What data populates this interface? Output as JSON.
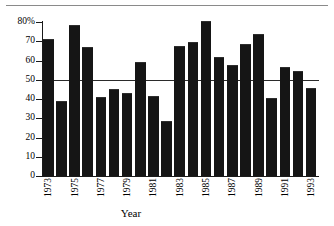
{
  "chart_data": {
    "type": "bar",
    "title": "",
    "subtitle": "",
    "xlabel": "Year",
    "ylabel": "",
    "categories": [
      "1973",
      "1974",
      "1975",
      "1976",
      "1977",
      "1978",
      "1979",
      "1980",
      "1981",
      "1982",
      "1983",
      "1984",
      "1985",
      "1986",
      "1987",
      "1988",
      "1989",
      "1990",
      "1991",
      "1992",
      "1993"
    ],
    "values": [
      71,
      39,
      78.5,
      67,
      41,
      45,
      43,
      59,
      41.5,
      28.5,
      67.5,
      69.5,
      80.5,
      62,
      57.5,
      68.5,
      74,
      40.5,
      56.5,
      54.5,
      45.5
    ],
    "ylim": [
      0,
      80
    ],
    "yticks": [
      0,
      10,
      20,
      30,
      40,
      50,
      60,
      70,
      80
    ],
    "ytick_labels": [
      "0",
      "10",
      "20",
      "30",
      "40",
      "50",
      "60",
      "70",
      "80%"
    ],
    "xtick_labels": [
      "1973",
      "1975",
      "1977",
      "1979",
      "1981",
      "1983",
      "1985",
      "1987",
      "1989",
      "1991",
      "1993"
    ],
    "grid": false,
    "legend": null,
    "annotations": [
      {
        "name": "reference-line-50-percent",
        "type": "hline",
        "value": 50,
        "label": ""
      }
    ],
    "bar_color": "#151515",
    "axis_color": "#1a1a1a",
    "reference_line_color": "#2b2b2b"
  }
}
